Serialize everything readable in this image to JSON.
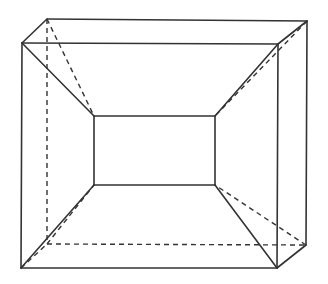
{
  "diagram": {
    "type": "geometry-solid",
    "stroke_color": "#333333",
    "background": "#ffffff",
    "vertices": {
      "front_top_left": [
        22,
        43
      ],
      "front_top_right": [
        278,
        44
      ],
      "front_bottom_right": [
        277,
        268
      ],
      "front_bottom_left": [
        21,
        268
      ],
      "back_top_left": [
        47,
        19
      ],
      "back_top_right": [
        307,
        21
      ],
      "back_bottom_right": [
        306,
        245
      ],
      "back_bottom_left": [
        47,
        244
      ],
      "inner_top_left": [
        94,
        116
      ],
      "inner_top_right": [
        215,
        116
      ],
      "inner_bottom_right": [
        215,
        185
      ],
      "inner_bottom_left": [
        94,
        185
      ]
    },
    "solid_edges": [
      [
        "front_top_left",
        "front_top_right"
      ],
      [
        "front_top_right",
        "front_bottom_right"
      ],
      [
        "front_bottom_right",
        "front_bottom_left"
      ],
      [
        "front_bottom_left",
        "front_top_left"
      ],
      [
        "back_top_left",
        "back_top_right"
      ],
      [
        "back_top_right",
        "back_bottom_right"
      ],
      [
        "front_top_left",
        "back_top_left"
      ],
      [
        "front_top_right",
        "back_top_right"
      ],
      [
        "front_bottom_right",
        "back_bottom_right"
      ],
      [
        "inner_top_left",
        "inner_top_right"
      ],
      [
        "inner_top_right",
        "inner_bottom_right"
      ],
      [
        "inner_bottom_right",
        "inner_bottom_left"
      ],
      [
        "inner_bottom_left",
        "inner_top_left"
      ],
      [
        "front_top_left",
        "inner_top_left"
      ],
      [
        "front_top_right",
        "inner_top_right"
      ],
      [
        "front_bottom_right",
        "inner_bottom_right"
      ],
      [
        "front_bottom_left",
        "inner_bottom_left"
      ]
    ],
    "dashed_edges": [
      [
        "back_top_left",
        "back_bottom_left"
      ],
      [
        "back_bottom_left",
        "back_bottom_right"
      ],
      [
        "front_bottom_left",
        "back_bottom_left"
      ],
      [
        "back_top_left",
        "inner_top_left"
      ],
      [
        "back_top_right",
        "inner_top_right"
      ],
      [
        "back_bottom_right",
        "inner_bottom_right"
      ],
      [
        "back_bottom_left",
        "inner_bottom_left"
      ]
    ]
  }
}
